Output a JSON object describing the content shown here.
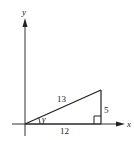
{
  "diagram": {
    "type": "right-triangle-on-axes",
    "axes": {
      "x_label": "x",
      "y_label": "y"
    },
    "triangle": {
      "hypotenuse_label": "13",
      "opposite_label": "5",
      "adjacent_label": "12",
      "angle_label": "γ",
      "right_angle_marker": true
    },
    "colors": {
      "line": "#222222",
      "axis": "#333333",
      "background": "#ffffff"
    }
  }
}
